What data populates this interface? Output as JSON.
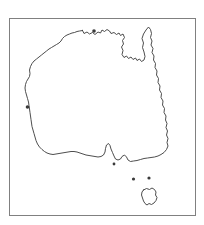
{
  "figure": {
    "kind": "distribution-map",
    "background_color": "#ffffff",
    "frame": {
      "border_color": "#808080",
      "border_width_px": 1,
      "fill_color": "#ffffff",
      "left_px": 9,
      "top_px": 18,
      "width_px": 187,
      "height_px": 198
    }
  },
  "map": {
    "outline": {
      "name": "australia-mainland",
      "stroke_color": "#3a3a3a",
      "fill_color": "#ffffff",
      "stroke_width": 0.9
    },
    "islands": [
      {
        "name": "tasmania",
        "stroke_color": "#3a3a3a",
        "fill_color": "#ffffff"
      }
    ],
    "islets": [
      {
        "name": "bass-strait-islet-west"
      },
      {
        "name": "bass-strait-islet-east"
      },
      {
        "name": "kangaroo-island"
      }
    ],
    "features": [
      {
        "name": "cape-york-peninsula"
      },
      {
        "name": "gulf-of-carpentaria"
      },
      {
        "name": "arnhem-land"
      },
      {
        "name": "kimberley-coast"
      },
      {
        "name": "shark-bay"
      },
      {
        "name": "great-australian-bight"
      },
      {
        "name": "spencer-gulf"
      },
      {
        "name": "gulf-st-vincent"
      },
      {
        "name": "bass-strait"
      },
      {
        "name": "east-coast"
      }
    ]
  },
  "overlay": {
    "shaded_region": {
      "name": "distribution-range-shading",
      "label": "",
      "shape": "crescent",
      "fill_color": "#e6e6e6",
      "edge_fill_color": "#f0f0f0",
      "opacity": 1,
      "location_description": "inland eastern Australia",
      "bbox_px": {
        "x": 131,
        "y": 88,
        "width": 25,
        "height": 60
      }
    }
  },
  "legend": {
    "present": false,
    "entries": []
  },
  "labels": {
    "title": "",
    "caption": "",
    "annotations": []
  }
}
